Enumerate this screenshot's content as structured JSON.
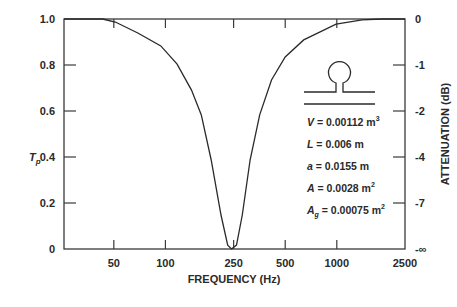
{
  "chart_data": {
    "type": "line",
    "title": "",
    "xlabel": "FREQUENCY (Hz)",
    "ylabel": "T_p",
    "ylabel_main": "T",
    "ylabel_sub": "p",
    "y2label": "ATTENUATION (dB)",
    "xscale": "log",
    "xlim": [
      25.6,
      2500
    ],
    "ylim": [
      0,
      1.0
    ],
    "grid": false,
    "legend": null,
    "x_ticks": [
      {
        "value": 50,
        "label": "50"
      },
      {
        "value": 100,
        "label": "100"
      },
      {
        "value": 250,
        "label": "250"
      },
      {
        "value": 500,
        "label": "500"
      },
      {
        "value": 1000,
        "label": "1000"
      },
      {
        "value": 2500,
        "label": "2500"
      }
    ],
    "y_ticks": [
      {
        "value": 0,
        "label": "0"
      },
      {
        "value": 0.2,
        "label": "0.2"
      },
      {
        "value": 0.4,
        "label": "0.4"
      },
      {
        "value": 0.6,
        "label": "0.6"
      },
      {
        "value": 0.8,
        "label": "0.8"
      },
      {
        "value": 1.0,
        "label": "1.0"
      }
    ],
    "y2_ticks": [
      {
        "value": 1.0,
        "label": "0"
      },
      {
        "value": 0.8,
        "label": "-1"
      },
      {
        "value": 0.6,
        "label": "-2"
      },
      {
        "value": 0.4,
        "label": "-4"
      },
      {
        "value": 0.2,
        "label": "-7"
      },
      {
        "value": 0,
        "label": "-∞"
      }
    ],
    "series": [
      {
        "name": "T_p",
        "color": "#2a2a2a",
        "x": [
          25.6,
          43,
          51,
          69,
          94,
          117,
          142,
          162,
          185,
          211,
          231,
          243,
          260,
          281,
          312,
          355,
          416,
          500,
          641,
          990,
          1407,
          1827,
          2500
        ],
        "values": [
          1.0,
          1.0,
          0.987,
          0.939,
          0.883,
          0.804,
          0.691,
          0.583,
          0.387,
          0.148,
          0.017,
          0.0,
          0.017,
          0.148,
          0.387,
          0.583,
          0.735,
          0.835,
          0.909,
          0.978,
          0.996,
          1.0,
          1.0
        ]
      }
    ],
    "annotations": {
      "inset_icon": "helmholtz-resonator-icon",
      "parameters": [
        {
          "symbol": "V",
          "sub": "",
          "text": " = 0.00112 m",
          "sup": "3"
        },
        {
          "symbol": "L",
          "sub": "",
          "text": " = 0.006 m",
          "sup": ""
        },
        {
          "symbol": "a",
          "sub": "",
          "text": " = 0.0155 m",
          "sup": ""
        },
        {
          "symbol": "A",
          "sub": "",
          "text": " = 0.0028 m",
          "sup": "2"
        },
        {
          "symbol": "A",
          "sub": "g",
          "text": " = 0.00075 m",
          "sup": "2"
        }
      ]
    }
  },
  "colors": {
    "line": "#2a2a2a",
    "axis": "#3a3a3a",
    "text": "#2a2a2a",
    "background": "#ffffff"
  }
}
